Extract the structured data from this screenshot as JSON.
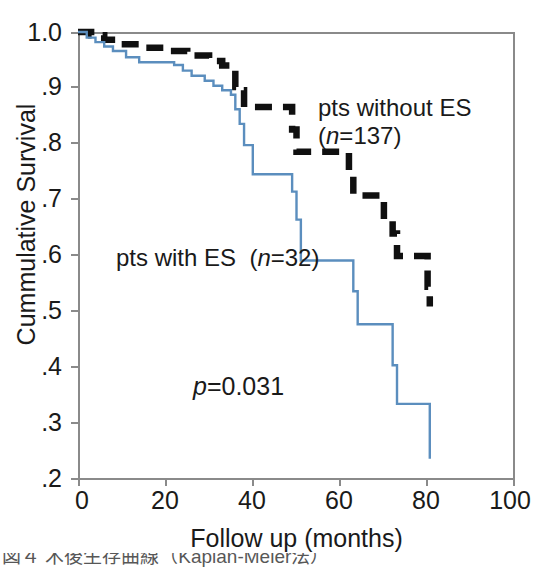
{
  "chart_data": {
    "type": "line",
    "title": "",
    "subtitle": "",
    "xlabel": "Follow up (months)",
    "ylabel": "Cummulative Survival",
    "xlim": [
      0,
      100
    ],
    "ylim": [
      0.2,
      1.0
    ],
    "xticks": [
      0,
      20,
      40,
      60,
      80,
      100
    ],
    "xtick_labels": [
      "0",
      "20",
      "40",
      "60",
      "80",
      "100"
    ],
    "yticks": [
      0.2,
      0.3,
      0.4,
      0.5,
      0.6,
      0.7,
      0.8,
      0.9,
      1.0
    ],
    "ytick_labels": [
      ".2",
      ".3",
      ".4",
      ".5",
      ".6",
      ".7",
      ".8",
      ".9",
      "1.0"
    ],
    "grid": false,
    "legend_position": "in-plot-annotations",
    "annotations": [
      {
        "id": "group-without-es",
        "line1": "pts without ES",
        "line2": "(n=137)",
        "n": 137,
        "italic_token": "n"
      },
      {
        "id": "group-with-es",
        "text": "pts with ES  (n=32)",
        "n": 32,
        "italic_token": "n"
      },
      {
        "id": "p-value",
        "text": "p=0.031",
        "value": 0.031,
        "italic_token": "p"
      }
    ],
    "series": [
      {
        "name": "pts with ES",
        "style": "solid",
        "color": "#5b8ebe",
        "n": 32,
        "steps": [
          [
            0,
            1.0
          ],
          [
            2,
            0.99
          ],
          [
            4,
            0.982
          ],
          [
            6,
            0.974
          ],
          [
            8,
            0.966
          ],
          [
            11,
            0.955
          ],
          [
            14,
            0.946
          ],
          [
            22,
            0.941
          ],
          [
            24,
            0.931
          ],
          [
            26,
            0.922
          ],
          [
            29,
            0.913
          ],
          [
            31,
            0.904
          ],
          [
            33,
            0.896
          ],
          [
            35,
            0.888
          ],
          [
            36,
            0.862
          ],
          [
            37,
            0.836
          ],
          [
            38,
            0.798
          ],
          [
            40,
            0.746
          ],
          [
            48,
            0.746
          ],
          [
            49,
            0.715
          ],
          [
            50,
            0.665
          ],
          [
            51,
            0.592
          ],
          [
            62,
            0.592
          ],
          [
            63,
            0.537
          ],
          [
            64,
            0.478
          ],
          [
            71,
            0.478
          ],
          [
            72,
            0.405
          ],
          [
            73,
            0.336
          ],
          [
            80,
            0.336
          ],
          [
            80.5,
            0.238
          ]
        ]
      },
      {
        "name": "pts without ES",
        "style": "dashed",
        "color": "#101010",
        "n": 137,
        "steps": [
          [
            0,
            1.0
          ],
          [
            3,
            0.994
          ],
          [
            6,
            0.986
          ],
          [
            9,
            0.978
          ],
          [
            14,
            0.972
          ],
          [
            22,
            0.966
          ],
          [
            25,
            0.958
          ],
          [
            30,
            0.948
          ],
          [
            33,
            0.94
          ],
          [
            35,
            0.932
          ],
          [
            36,
            0.902
          ],
          [
            37.5,
            0.896
          ],
          [
            38,
            0.866
          ],
          [
            48,
            0.866
          ],
          [
            49,
            0.826
          ],
          [
            50,
            0.786
          ],
          [
            61,
            0.786
          ],
          [
            62,
            0.742
          ],
          [
            63,
            0.708
          ],
          [
            69,
            0.708
          ],
          [
            70,
            0.665
          ],
          [
            72,
            0.64
          ],
          [
            73,
            0.6
          ],
          [
            79,
            0.6
          ],
          [
            80,
            0.545
          ],
          [
            80.5,
            0.51
          ]
        ]
      }
    ]
  },
  "caption": {
    "cropped_footer_text": "図４ 术後生存曲線（Kaplan-Meier法）"
  }
}
